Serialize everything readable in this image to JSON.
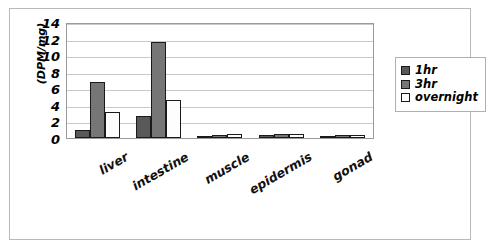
{
  "chart_data": {
    "type": "bar",
    "title": "",
    "xlabel": "",
    "ylabel": "(DPM/mg)",
    "ylim": [
      0,
      14
    ],
    "yticks": [
      14,
      12,
      10,
      8,
      6,
      4,
      2,
      0
    ],
    "grid": true,
    "legend_position": "right",
    "categories": [
      "liver",
      "intestine",
      "muscle",
      "epidermis",
      "gonad"
    ],
    "series": [
      {
        "name": "1hr",
        "color": "#595959",
        "values": [
          1.0,
          2.7,
          0.2,
          0.35,
          0.2
        ]
      },
      {
        "name": "3hr",
        "color": "#767676",
        "values": [
          6.8,
          11.6,
          0.4,
          0.5,
          0.4
        ]
      },
      {
        "name": "overnight",
        "color": "#ffffff",
        "values": [
          3.2,
          4.6,
          0.5,
          0.5,
          0.35
        ]
      }
    ]
  },
  "legend": {
    "items": [
      {
        "label": "1hr"
      },
      {
        "label": "3hr"
      },
      {
        "label": "overnight"
      }
    ]
  }
}
